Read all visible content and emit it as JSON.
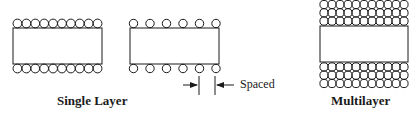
{
  "diagram": {
    "stroke_color": "#1a1a1a",
    "panels": [
      {
        "id": "single-layer-close",
        "circles_per_row": 10,
        "rows_top": 1,
        "rows_bottom": 1
      },
      {
        "id": "single-layer-spaced",
        "circles_per_row": 6,
        "rows_top": 1,
        "rows_bottom": 1
      },
      {
        "id": "multilayer",
        "circles_per_row": 11,
        "rows_top": 3,
        "rows_bottom": 3
      }
    ],
    "labels": {
      "single_layer": "Single Layer",
      "spaced": "Spaced",
      "multilayer": "Multilayer"
    }
  }
}
